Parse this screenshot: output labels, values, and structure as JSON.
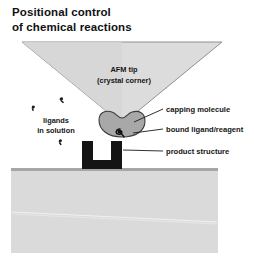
{
  "figure": {
    "title_line1": "Positional control",
    "title_line2": "of chemical reactions",
    "tip_label_line1": "AFM tip",
    "tip_label_line2": "(crystal corner)",
    "left_label_line1": "ligands",
    "left_label_line2": "in solution",
    "callouts": [
      {
        "label": "capping molecule"
      },
      {
        "label": "bound ligand/reagent"
      },
      {
        "label": "product structure"
      }
    ],
    "parts": {
      "afm_tip": "afm-tip-triangle",
      "capping_molecule": "capping-molecule-blob",
      "bound_ligand": "bound-ligand-mark",
      "product_structure": "product-structure-bracket",
      "substrate": "substrate-surface",
      "ligand_marks": "ligand-marks-in-solution"
    },
    "colors": {
      "background": "#ffffff",
      "tip_fill": "#dcdcdc",
      "tip_stroke": "#8c8c8c",
      "capping_fill": "#a8a8a8",
      "capping_stroke": "#3a3a3a",
      "product_fill": "#141414",
      "substrate_fill": "#d9d9d9",
      "substrate_stroke": "#9a9a9a",
      "text": "#151515",
      "leader_line": "#1a1a1a",
      "ligand_mark": "#202020"
    }
  }
}
